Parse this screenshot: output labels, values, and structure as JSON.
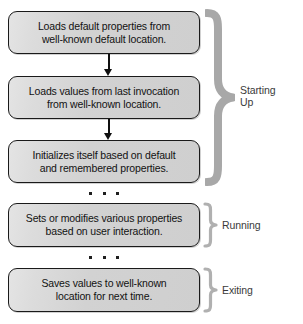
{
  "diagram": {
    "background_color": "#ffffff",
    "box_fill_color": "#d4d4d4",
    "box_border_color": "#1a1a1a",
    "brace_color": "#a8a8a8",
    "text_color": "#121212",
    "label_color": "#3a3a3a",
    "steps": [
      {
        "id": "load-defaults",
        "text": "Loads default properties from\nwell-known default location."
      },
      {
        "id": "load-last-invocation",
        "text": "Loads values from last invocation\nfrom well-known location."
      },
      {
        "id": "initialize",
        "text": "Initializes itself based on default\nand remembered properties."
      },
      {
        "id": "modify-properties",
        "text": "Sets or modifies various properties\nbased on user interaction."
      },
      {
        "id": "save-values",
        "text": "Saves values to well-known\nlocation for next time."
      }
    ],
    "phases": [
      {
        "id": "starting-up",
        "label": "Starting\nUp",
        "covers": [
          0,
          1,
          2
        ]
      },
      {
        "id": "running",
        "label": "Running",
        "covers": [
          3
        ]
      },
      {
        "id": "exiting",
        "label": "Exiting",
        "covers": [
          4
        ]
      }
    ],
    "connectors": [
      {
        "id": "arrow-1",
        "from": "load-defaults",
        "to": "load-last-invocation",
        "kind": "arrow"
      },
      {
        "id": "arrow-2",
        "from": "load-last-invocation",
        "to": "initialize",
        "kind": "arrow"
      },
      {
        "id": "ellipsis-1",
        "after": "initialize",
        "kind": "ellipsis",
        "glyph": "..."
      },
      {
        "id": "ellipsis-2",
        "after": "modify-properties",
        "kind": "ellipsis",
        "glyph": "..."
      }
    ]
  }
}
